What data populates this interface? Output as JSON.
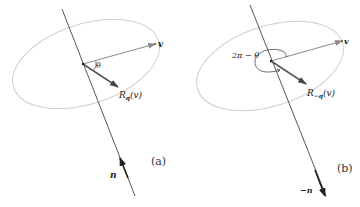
{
  "colors": {
    "axis": "#444444",
    "ellipse": "#cfcfcf",
    "vector_v": "#8a8a8a",
    "vector_r": "#555555",
    "text": "#222222"
  },
  "panel_a": {
    "caption": "(a)",
    "v_label": "v",
    "angle_label": "θ",
    "rotated_label_main": "R",
    "rotated_label_sub": "q",
    "rotated_label_arg": "(v)",
    "axis_label": "n"
  },
  "panel_b": {
    "caption": "(b)",
    "v_label": "v",
    "angle_label": "2π − θ",
    "rotated_label_main": "R",
    "rotated_label_sub": "−q",
    "rotated_label_arg": "(v)",
    "axis_label": "−n"
  }
}
